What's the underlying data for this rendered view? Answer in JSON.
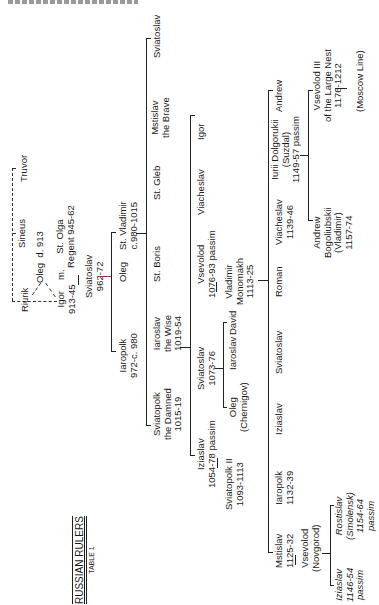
{
  "title": {
    "main": "RUSSIAN RULERS",
    "sub": "TABLE 1"
  },
  "header_fragment": "(cut-off running header)",
  "gen0": {
    "riurik": "Riurik",
    "sineus": "Sineus",
    "truvor": "Truvor"
  },
  "gen1": {
    "oleg": "Oleg  d. 913",
    "igor": "Igor\n913-45",
    "marriage": "m.",
    "olga": "St. Olga\nRegent 945-62"
  },
  "gen2": {
    "sviatoslav": "Sviatoslav\n962-72"
  },
  "gen3": {
    "iaropolk": "Iaropolk\n972-c. 980",
    "oleg": "Oleg",
    "vladimir": "St. Vladimir\nc.980-1015"
  },
  "gen4": {
    "sviatopolk": "Sviatopolk\nthe Damned\n1015-19",
    "iaroslav": "Iaroslav\nthe Wise\n1019-54",
    "boris": "St. Boris",
    "gleb": "St. Gleb",
    "mstislav": "Mstislav\nthe Brave",
    "sviatoslav": "Sviatoslav"
  },
  "gen5": {
    "iziaslav": "Iziaslav\n1054-78 passim",
    "sviatoslav": "Sviatoslav\n1073-76",
    "vsevolod": "Vsevolod\n1076-93 passim",
    "viacheslav": "Viacheslav",
    "igor": "Igor"
  },
  "gen6": {
    "sviatopolk2": "Sviatopolk II\n1093-1113",
    "oleg": "Oleg\n(Chernigov)",
    "iaroslav": "Iaroslav",
    "david": "David",
    "monomakh": "Vladimir\nMonomakh\n1113-25"
  },
  "gen7": {
    "mstislav": "Mstislav\n1125-32",
    "iaropolk": "Iaropolk\n1132-39",
    "iziaslav": "Iziaslav",
    "sviatoslav": "Sviatoslav",
    "roman": "Roman",
    "viacheslav": "Viacheslav\n1139-46",
    "iurii": "Iurii Dolgorukii\n(Suzdal)\n1149-57 passim",
    "andrew": "Andrew"
  },
  "gen8": {
    "vsevolod_novgorod": "Vsevolod\n(Novgorod)",
    "andrew_bogoliubskii": "Andrew\nBogoliubskii\n(Vladimir)\n1157-74",
    "vsevolod3": "Vsevolod III\nof the Large Nest\n1176-1212"
  },
  "gen9": {
    "iziaslav": "Iziaslav\n1146-54\npassim",
    "rostislav": "Rostislav\n(Smolensk)\n1154-64\npassim",
    "moscow": "(Moscow Line)"
  },
  "colors": {
    "ink": "#222222",
    "accent_line": "#b03040",
    "paper": "#ffffff"
  }
}
